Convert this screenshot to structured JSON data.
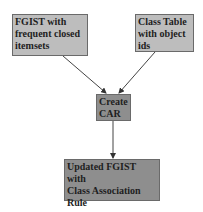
{
  "diagram": {
    "nodes": [
      {
        "id": "fgist",
        "label_lines": [
          "FGIST with",
          "frequent closed",
          "itemsets"
        ],
        "fill": "#bdbdbd"
      },
      {
        "id": "class_table",
        "label_lines": [
          "Class Table",
          "with object",
          "ids"
        ],
        "fill": "#bdbdbd"
      },
      {
        "id": "create_car",
        "label_lines": [
          "Create",
          "CAR"
        ],
        "fill": "#8e8e8e"
      },
      {
        "id": "updated_fgist",
        "label_lines": [
          "Updated FGIST with",
          "Class Association",
          "Rule"
        ],
        "fill": "#8e8e8e"
      }
    ],
    "edges": [
      {
        "from": "fgist",
        "to": "create_car"
      },
      {
        "from": "class_table",
        "to": "create_car"
      },
      {
        "from": "create_car",
        "to": "updated_fgist"
      }
    ]
  }
}
